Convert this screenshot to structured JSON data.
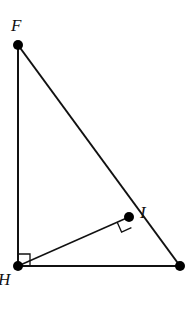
{
  "diagram": {
    "type": "geometry-right-triangle",
    "points": {
      "F": {
        "label": "F",
        "x": 18,
        "y": 45
      },
      "H": {
        "label": "H",
        "x": 18,
        "y": 266
      },
      "I": {
        "label": "I",
        "x": 129,
        "y": 217
      },
      "J": {
        "label": "",
        "x": 180,
        "y": 266
      }
    },
    "segments": [
      {
        "from": "F",
        "to": "H"
      },
      {
        "from": "H",
        "to": "J"
      },
      {
        "from": "F",
        "to": "J"
      },
      {
        "from": "H",
        "to": "I"
      }
    ],
    "right_angles": [
      {
        "at": "H",
        "between": [
          "F",
          "J"
        ]
      },
      {
        "at": "I",
        "between": [
          "H",
          "J"
        ]
      }
    ],
    "colors": {
      "stroke": "#111111",
      "point": "#000000",
      "background": "#ffffff"
    }
  }
}
